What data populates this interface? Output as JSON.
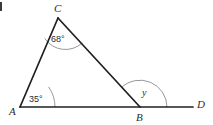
{
  "figure": {
    "type": "geometry-diagram",
    "background_color": "#ffffff",
    "stroke_color": "#1f1f1f",
    "arc_color": "#8c8c8c",
    "text_color": "#2b2b2b",
    "points": {
      "A": {
        "x": 20,
        "y": 107
      },
      "B": {
        "x": 140,
        "y": 107
      },
      "C": {
        "x": 58,
        "y": 18
      },
      "D": {
        "x": 193,
        "y": 107
      }
    },
    "segments": [
      {
        "name": "AC",
        "from": "A",
        "to": "C"
      },
      {
        "name": "CB",
        "from": "C",
        "to": "B"
      },
      {
        "name": "AD",
        "from": "A",
        "to": "D"
      }
    ],
    "vertex_labels": [
      {
        "id": "label-A",
        "text": "A",
        "x": 9,
        "y": 106
      },
      {
        "id": "label-B",
        "text": "B",
        "x": 136,
        "y": 112
      },
      {
        "id": "label-C",
        "text": "C",
        "x": 54,
        "y": 3
      },
      {
        "id": "label-D",
        "text": "D",
        "x": 197,
        "y": 99
      }
    ],
    "angles": [
      {
        "id": "angle-C",
        "vertex": "C",
        "label": "68°",
        "value": 68,
        "unit": "degrees",
        "arc_radius": 25,
        "label_x": 51,
        "label_y": 35
      },
      {
        "id": "angle-A",
        "vertex": "A",
        "label": "35°",
        "value": 35,
        "unit": "degrees",
        "arc_radius": 35,
        "label_x": 29,
        "label_y": 95
      },
      {
        "id": "angle-y",
        "vertex": "B",
        "label": "y",
        "value": null,
        "unit": "degrees",
        "arc_radius": 27,
        "label_x": 142,
        "label_y": 88
      }
    ],
    "corner_mark": {
      "present": true,
      "x": 0,
      "y": 2,
      "width": 2,
      "height": 9,
      "color": "#3a3a3a"
    }
  }
}
